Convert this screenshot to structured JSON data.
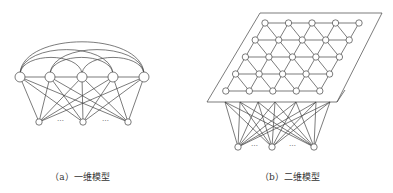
{
  "figures": [
    {
      "id": "a",
      "caption": "（a）一维模型",
      "output_layer": {
        "count": 5,
        "arrangement": "1D chain",
        "lateral_connections": "all-to-all arcs"
      },
      "input_layer": {
        "count": 3,
        "ellipsis": [
          "…",
          "…"
        ]
      }
    },
    {
      "id": "b",
      "caption": "（b）二维模型",
      "output_layer": {
        "rows": 5,
        "cols": 5,
        "arrangement": "2D triangular lattice on plane"
      },
      "input_layer": {
        "count": 3,
        "ellipsis": [
          "…",
          "…"
        ]
      }
    }
  ],
  "colors": {
    "line": "#444444",
    "node_fill": "#ffffff",
    "background": "#ffffff"
  }
}
